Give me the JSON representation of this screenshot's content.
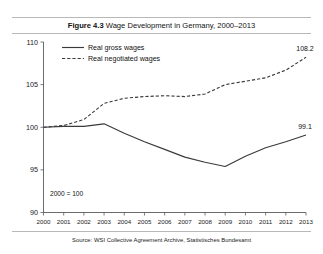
{
  "figure": {
    "label": "Figure 4.3",
    "title": " Wage Development in Germany, 2000–2013",
    "source": "Source: WSI Collective Agreement Archive, Statistisches Bundesamt",
    "note": "2000 = 100"
  },
  "chart_data": {
    "type": "line",
    "title": "Figure 4.3 Wage Development in Germany, 2000–2013",
    "xlabel": "",
    "ylabel": "",
    "note": "2000 = 100",
    "source": "Source: WSI Collective Agreement Archive, Statistisches Bundesamt",
    "grid": false,
    "legend_position": "top-left",
    "x": [
      2000,
      2001,
      2002,
      2003,
      2004,
      2005,
      2006,
      2007,
      2008,
      2009,
      2010,
      2011,
      2012,
      2013
    ],
    "categories": [
      "2000",
      "2001",
      "2002",
      "2003",
      "2004",
      "2005",
      "2006",
      "2007",
      "2008",
      "2009",
      "2010",
      "2011",
      "2012",
      "2013"
    ],
    "xlim": [
      2000,
      2013
    ],
    "ylim": [
      90,
      110
    ],
    "yticks": [
      90,
      95,
      100,
      105,
      110
    ],
    "ytick_labels": [
      "90",
      "95",
      "100",
      "105",
      "110"
    ],
    "series": [
      {
        "name": "Real gross wages",
        "style": "solid",
        "color": "#3a3a3a",
        "values": [
          100.0,
          100.1,
          100.1,
          100.4,
          99.3,
          98.3,
          97.4,
          96.5,
          95.9,
          95.4,
          96.6,
          97.6,
          98.3,
          99.1
        ],
        "end_label": "99.1"
      },
      {
        "name": "Real negotiated wages",
        "style": "dashed",
        "color": "#3a3a3a",
        "values": [
          100.0,
          100.2,
          100.9,
          102.8,
          103.4,
          103.6,
          103.7,
          103.6,
          103.9,
          105.0,
          105.4,
          105.8,
          106.7,
          108.2
        ],
        "end_label": "108.2"
      }
    ],
    "annotations": [
      {
        "text": "108.2",
        "x": 2013,
        "y": 108.2
      },
      {
        "text": "99.1",
        "x": 2013,
        "y": 99.1
      },
      {
        "text": "2000 = 100",
        "x": 2000.4,
        "y": 91.2
      }
    ]
  },
  "legend": {
    "items": [
      {
        "label": "Real gross wages",
        "style": "solid"
      },
      {
        "label": "Real negotiated wages",
        "style": "dashed"
      }
    ]
  }
}
